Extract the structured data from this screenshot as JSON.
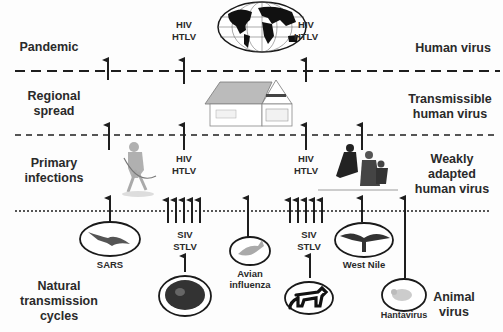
{
  "figure": {
    "levels": [
      {
        "stage": "Pandemic",
        "virus_type": "Human virus"
      },
      {
        "stage": "Regional spread",
        "virus_type": "Transmissible human virus"
      },
      {
        "stage": "Primary infections",
        "virus_type": "Weakly adapted human virus"
      },
      {
        "stage": "Natural transmission cycles",
        "virus_type": "Animal virus"
      }
    ],
    "left_labels": {
      "pandemic": "Pandemic",
      "regional_1": "Regional",
      "regional_2": "spread",
      "primary_1": "Primary",
      "primary_2": "infections",
      "natural_1": "Natural",
      "natural_2": "transmission",
      "natural_3": "cycles"
    },
    "right_labels": {
      "human": "Human virus",
      "trans_1": "Transmissible",
      "trans_2": "human virus",
      "weak_1": "Weakly",
      "weak_2": "adapted",
      "weak_3": "human virus",
      "animal_1": "Animal",
      "animal_2": "virus"
    },
    "virus_labels": {
      "pandemic_hiv": "HIV",
      "pandemic_htlv": "HTLV",
      "pandemic2_hiv": "HIV",
      "pandemic2_htlv": "HTLV",
      "primary_hiv": "HIV",
      "primary_htlv": "HTLV",
      "primary2_hiv": "HIV",
      "primary2_htlv": "HTLV",
      "siv1": "SIV",
      "stlv1": "STLV",
      "siv2": "SIV",
      "stlv2": "STLV"
    },
    "animal_captions": {
      "bat": "SARS",
      "bird": "Avian",
      "bird_2": "influenza",
      "westnile": "West Nile",
      "rodent": "Hantavirus"
    },
    "images": [
      "globe",
      "house",
      "hunter",
      "family",
      "bat",
      "chimpanzee",
      "bird",
      "monkey",
      "crow",
      "rodent"
    ],
    "colors": {
      "line": "#1e1e1e",
      "text": "#2a2a2a",
      "background": "#fdfdfd"
    }
  }
}
